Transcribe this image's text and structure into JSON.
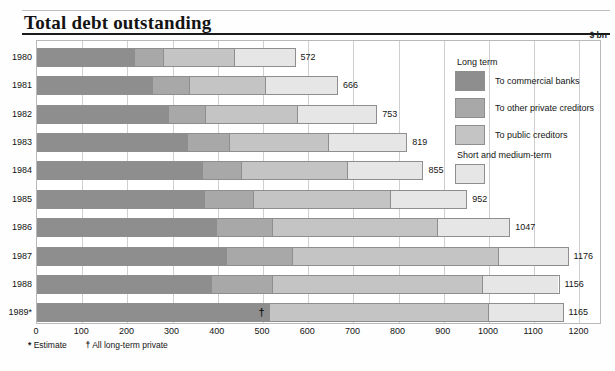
{
  "title": "Total debt outstanding",
  "unit": "$ bn",
  "footnote": {
    "estimate_symbol": "*",
    "estimate_text": "Estimate",
    "dagger_symbol": "†",
    "dagger_text": "All long-term private"
  },
  "legend": {
    "heading_long": "Long term",
    "heading_short": "Short and medium-term",
    "items": [
      {
        "label": "To commercial banks",
        "color": "#8e8e8e"
      },
      {
        "label": "To other private creditors",
        "color": "#a8a8a8"
      },
      {
        "label": "To public creditors",
        "color": "#c4c4c4"
      },
      {
        "label": "Short and medium-term",
        "color": "#e6e6e6"
      }
    ]
  },
  "marker": {
    "symbol": "†",
    "year": "1989*",
    "value": 512
  },
  "chart_data": {
    "type": "bar",
    "orientation": "horizontal",
    "stacked": true,
    "title": "Total debt outstanding",
    "xlabel": "$ bn",
    "ylabel": "",
    "xlim": [
      0,
      1250
    ],
    "xticks": [
      0,
      100,
      200,
      300,
      400,
      500,
      600,
      700,
      800,
      900,
      1000,
      1100,
      1200
    ],
    "xticklabels": [
      "0",
      "100",
      "200",
      "300",
      "400",
      "500",
      "600",
      "700",
      "800",
      "900",
      "1000",
      "1100",
      "1200"
    ],
    "grid": true,
    "legend_position": "inside-right",
    "categories": [
      "1980",
      "1981",
      "1982",
      "1983",
      "1984",
      "1985",
      "1986",
      "1987",
      "1988",
      "1989*"
    ],
    "totals": [
      572,
      666,
      753,
      819,
      855,
      952,
      1047,
      1176,
      1156,
      1165
    ],
    "total_labels": [
      "572",
      "666",
      "753",
      "819",
      "855",
      "952",
      "1047",
      "1176",
      "1156",
      "1165"
    ],
    "series": [
      {
        "name": "To commercial banks",
        "color": "#8e8e8e",
        "values": [
          213,
          254,
          290,
          332,
          364,
          370,
          395,
          417,
          385,
          512
        ]
      },
      {
        "name": "To other private creditors",
        "color": "#a8a8a8",
        "values": [
          65,
          82,
          82,
          92,
          88,
          108,
          125,
          147,
          135,
          0
        ]
      },
      {
        "name": "To public creditors",
        "color": "#c4c4c4",
        "values": [
          160,
          170,
          205,
          220,
          236,
          304,
          367,
          457,
          465,
          488
        ]
      },
      {
        "name": "Short and medium-term",
        "color": "#e6e6e6",
        "values": [
          134,
          160,
          176,
          175,
          167,
          170,
          160,
          155,
          171,
          165
        ]
      }
    ]
  }
}
